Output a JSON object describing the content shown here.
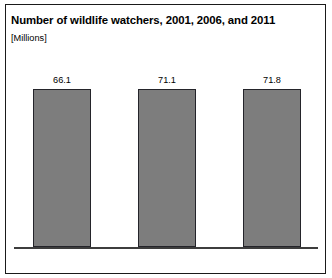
{
  "chart_data": {
    "type": "bar",
    "title": "Number of wildlife watchers, 2001, 2006, and 2011",
    "subtitle": "[Millions]",
    "xlabel": "",
    "ylabel": "Millions",
    "categories": [
      "2001",
      "2006",
      "2011"
    ],
    "values": [
      66.1,
      71.1,
      71.8
    ],
    "value_labels": [
      "66.1",
      "71.1",
      "71.8"
    ],
    "ylim": [
      0,
      80
    ],
    "grid": false,
    "legend": false,
    "bar_color": "#7d7d7d",
    "bar_edge_color": "#24242a",
    "axis_color": "#3d3d3d",
    "background": "#ffffff"
  }
}
